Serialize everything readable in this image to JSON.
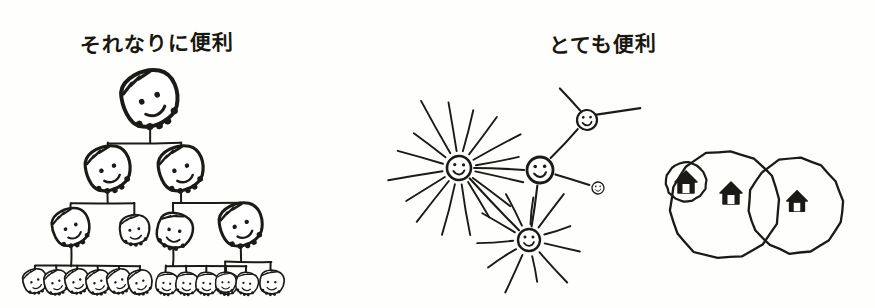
{
  "page": {
    "background_color": "#fefefd",
    "ink_color": "#1b1a16",
    "width": 875,
    "height": 308,
    "style": "hand-drawn marker sketch"
  },
  "panels": [
    {
      "id": "hierarchy",
      "title": "それなりに便利",
      "title_reading": "sorenari ni benri",
      "title_meaning": "reasonably useful",
      "figure_type": "org-chart-tree",
      "node_glyph": "face-with-hair",
      "levels": 5,
      "node_counts_by_level": [
        1,
        2,
        4,
        13,
        0
      ],
      "total_nodes": 20
    },
    {
      "id": "network",
      "title": "とても便利",
      "title_reading": "totemo benri",
      "title_meaning": "very useful",
      "figure_type": "hub-and-spoke-network",
      "node_glyph": "smiley-face",
      "node_count": 4,
      "hub_count": 2
    },
    {
      "id": "venn",
      "title": "",
      "figure_type": "overlapping-circles",
      "node_glyph": "house",
      "circle_count": 2,
      "house_count": 3
    }
  ],
  "hierarchy": {
    "title": "それなりに便利",
    "root": {
      "id": "n-root",
      "cx": 150,
      "cy": 103,
      "size": 30,
      "tilt": -18
    },
    "level2": [
      {
        "id": "n-l2-a",
        "cx": 108,
        "cy": 172,
        "size": 24,
        "tilt": -16
      },
      {
        "id": "n-l2-b",
        "cx": 181,
        "cy": 172,
        "size": 24,
        "tilt": -16
      }
    ],
    "level3": [
      {
        "id": "n-l3-a",
        "cx": 71,
        "cy": 230,
        "size": 20,
        "tilt": -18
      },
      {
        "id": "n-l3-b",
        "cx": 134,
        "cy": 232,
        "size": 16,
        "tilt": -4
      },
      {
        "id": "n-l3-c",
        "cx": 173,
        "cy": 233,
        "size": 19,
        "tilt": 16
      },
      {
        "id": "n-l3-d",
        "cx": 241,
        "cy": 228,
        "size": 23,
        "tilt": -16
      }
    ],
    "leaves_group_a": [
      {
        "id": "n-leaf-a1",
        "cx": 35,
        "cy": 283,
        "size": 13,
        "tilt": -16
      },
      {
        "id": "n-leaf-a2",
        "cx": 56,
        "cy": 284,
        "size": 13,
        "tilt": -14
      },
      {
        "id": "n-leaf-a3",
        "cx": 77,
        "cy": 283,
        "size": 13,
        "tilt": -16
      },
      {
        "id": "n-leaf-a4",
        "cx": 98,
        "cy": 284,
        "size": 13,
        "tilt": -14
      },
      {
        "id": "n-leaf-a5",
        "cx": 119,
        "cy": 283,
        "size": 13,
        "tilt": -16
      },
      {
        "id": "n-leaf-a6",
        "cx": 140,
        "cy": 284,
        "size": 13,
        "tilt": -14
      }
    ],
    "leaves_group_b": [
      {
        "id": "n-leaf-b1",
        "cx": 166,
        "cy": 285,
        "size": 12,
        "tilt": 14
      },
      {
        "id": "n-leaf-b2",
        "cx": 186,
        "cy": 285,
        "size": 12,
        "tilt": 14
      },
      {
        "id": "n-leaf-b3",
        "cx": 206,
        "cy": 285,
        "size": 12,
        "tilt": 14
      },
      {
        "id": "n-leaf-b4",
        "cx": 226,
        "cy": 285,
        "size": 12,
        "tilt": 14
      },
      {
        "id": "n-leaf-b5",
        "cx": 246,
        "cy": 285,
        "size": 12,
        "tilt": 14
      }
    ],
    "leaves_group_c": [
      {
        "id": "n-leaf-c1",
        "cx": 225,
        "cy": 284,
        "size": 11,
        "tilt": 6
      },
      {
        "id": "n-leaf-c2",
        "cx": 271,
        "cy": 284,
        "size": 13,
        "tilt": 8
      }
    ],
    "edges": [
      {
        "from": "n-root",
        "to": "bus-1"
      },
      {
        "from": "bus-1",
        "to": "n-l2-a"
      },
      {
        "from": "bus-1",
        "to": "n-l2-b"
      },
      {
        "from": "n-l2-a",
        "to": "bus-2a"
      },
      {
        "from": "n-l2-b",
        "to": "bus-2b"
      },
      {
        "from": "bus-2a",
        "to": "n-l3-a"
      },
      {
        "from": "bus-2a",
        "to": "n-l3-b"
      },
      {
        "from": "bus-2b",
        "to": "n-l3-c"
      },
      {
        "from": "bus-2b",
        "to": "n-l3-d"
      },
      {
        "from": "n-l3-a",
        "to": "bus-3a"
      },
      {
        "from": "n-l3-c",
        "to": "bus-3b"
      },
      {
        "from": "n-l3-d",
        "to": "bus-3c"
      }
    ]
  },
  "network": {
    "title": "とても便利",
    "nodes": [
      {
        "id": "hub-left",
        "cx": 459,
        "cy": 168,
        "r": 12,
        "spokes": 16,
        "spoke_len": 72,
        "label_role": "hub"
      },
      {
        "id": "node-center",
        "cx": 540,
        "cy": 170,
        "r": 13,
        "spokes": 0,
        "spoke_len": 0,
        "label_role": "connector"
      },
      {
        "id": "node-topright",
        "cx": 587,
        "cy": 120,
        "r": 10,
        "spokes": 0,
        "spoke_len": 0,
        "label_role": "connector"
      },
      {
        "id": "node-small",
        "cx": 598,
        "cy": 188,
        "r": 6,
        "spokes": 0,
        "spoke_len": 0,
        "label_role": "leaf"
      },
      {
        "id": "hub-bottom",
        "cx": 529,
        "cy": 240,
        "r": 11,
        "spokes": 11,
        "spoke_len": 52,
        "label_role": "hub"
      }
    ],
    "links": [
      {
        "from": "hub-left",
        "to": "node-center"
      },
      {
        "from": "node-center",
        "to": "node-topright"
      },
      {
        "from": "node-center",
        "to": "node-small"
      },
      {
        "from": "node-center",
        "to": "hub-bottom"
      },
      {
        "from": "hub-left",
        "to": "hub-bottom"
      }
    ]
  },
  "venn": {
    "circles": [
      {
        "id": "circle-left",
        "cx": 724,
        "cy": 205,
        "r": 55
      },
      {
        "id": "circle-right",
        "cx": 795,
        "cy": 206,
        "r": 48
      }
    ],
    "houses": [
      {
        "id": "house-circled",
        "cx": 686,
        "cy": 182,
        "size": 15,
        "circled": true
      },
      {
        "id": "house-center",
        "cx": 731,
        "cy": 193,
        "size": 15,
        "circled": false
      },
      {
        "id": "house-right",
        "cx": 797,
        "cy": 201,
        "size": 14,
        "circled": false
      }
    ]
  }
}
